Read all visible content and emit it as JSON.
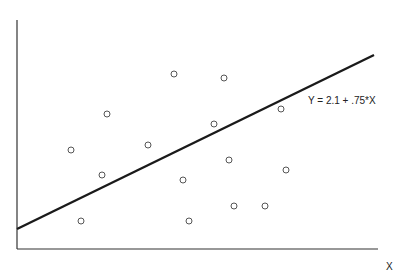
{
  "chart_data": {
    "type": "scatter",
    "title": "",
    "xlabel": "X",
    "ylabel": "",
    "grid": false,
    "legend": null,
    "annotation": "Y = 2.1 + .75*X",
    "regression_line": {
      "intercept": 2.1,
      "slope": 0.75,
      "color": "#1a1a1a"
    },
    "marker": {
      "shape": "open-circle",
      "color": "#555555"
    },
    "points_px": [
      [
        174,
        74
      ],
      [
        224,
        78
      ],
      [
        107,
        114
      ],
      [
        214,
        124
      ],
      [
        281,
        109
      ],
      [
        71,
        150
      ],
      [
        148,
        145
      ],
      [
        229,
        160
      ],
      [
        102,
        175
      ],
      [
        183,
        180
      ],
      [
        286,
        170
      ],
      [
        81,
        221
      ],
      [
        189,
        221
      ],
      [
        234,
        206
      ],
      [
        265,
        206
      ]
    ]
  },
  "axes": {
    "origin_px": [
      17,
      249
    ],
    "x_end_px": 378,
    "y_top_px": 20,
    "line_start_px": [
      17,
      229
    ],
    "line_end_px": [
      374,
      55
    ]
  }
}
